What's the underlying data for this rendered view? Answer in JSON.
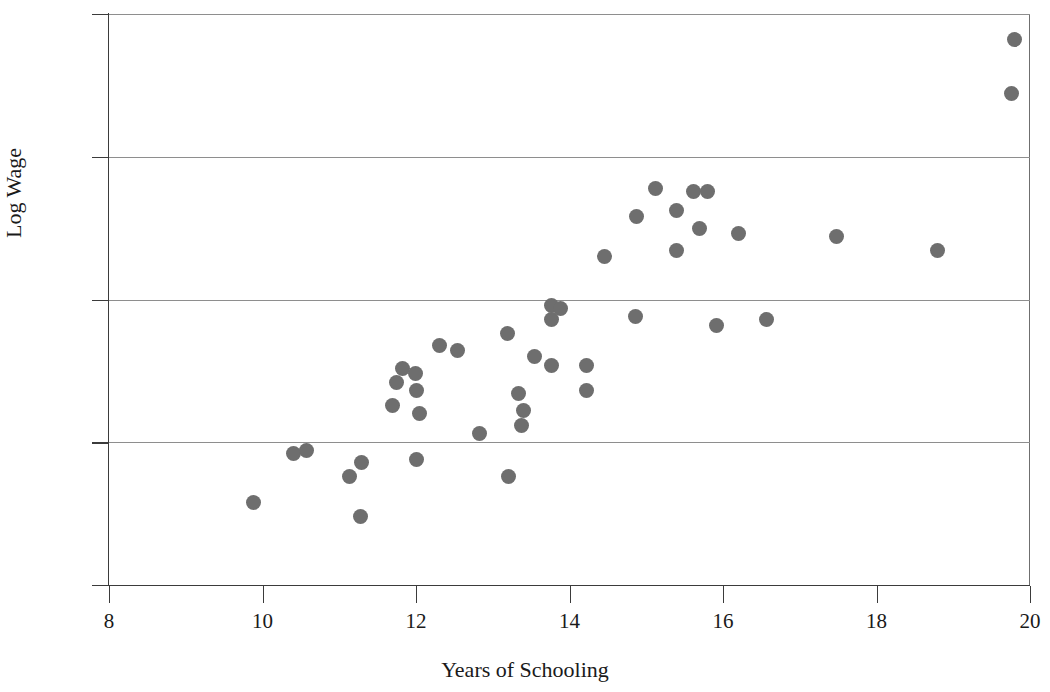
{
  "chart_data": {
    "type": "scatter",
    "title": "",
    "xlabel": "Years of Schooling",
    "ylabel": "Log Wage",
    "xlim": [
      8,
      20
    ],
    "ylim": [
      2,
      4
    ],
    "xticks": [
      "8",
      "10",
      "12",
      "14",
      "16",
      "18",
      "20"
    ],
    "xtick_values": [
      8,
      10,
      12,
      14,
      16,
      18,
      20
    ],
    "yticks": [
      "2",
      "2.5",
      "3",
      "3.5",
      "4"
    ],
    "ytick_values": [
      2,
      2.5,
      3,
      3.5,
      4
    ],
    "grid": "horizontal",
    "gridline_values": [
      2.5,
      3,
      3.5,
      4
    ],
    "legend": null,
    "marker_color": "#6e6e6e",
    "marker_shape": "circle",
    "marker_size_px": 15,
    "point_count": 48,
    "points": [
      {
        "x": 9.88,
        "y": 2.29
      },
      {
        "x": 10.41,
        "y": 2.46
      },
      {
        "x": 10.57,
        "y": 2.47
      },
      {
        "x": 11.14,
        "y": 2.38
      },
      {
        "x": 11.29,
        "y": 2.43
      },
      {
        "x": 11.28,
        "y": 2.24
      },
      {
        "x": 11.7,
        "y": 2.63
      },
      {
        "x": 11.74,
        "y": 2.71
      },
      {
        "x": 11.83,
        "y": 2.76
      },
      {
        "x": 11.99,
        "y": 2.74
      },
      {
        "x": 12.0,
        "y": 2.68
      },
      {
        "x": 12.04,
        "y": 2.6
      },
      {
        "x": 12.0,
        "y": 2.44
      },
      {
        "x": 12.31,
        "y": 2.84
      },
      {
        "x": 12.54,
        "y": 2.82
      },
      {
        "x": 12.83,
        "y": 2.53
      },
      {
        "x": 13.19,
        "y": 2.88
      },
      {
        "x": 13.2,
        "y": 2.38
      },
      {
        "x": 13.33,
        "y": 2.67
      },
      {
        "x": 13.4,
        "y": 2.61
      },
      {
        "x": 13.38,
        "y": 2.56
      },
      {
        "x": 13.54,
        "y": 2.8
      },
      {
        "x": 13.76,
        "y": 2.77
      },
      {
        "x": 13.76,
        "y": 2.93
      },
      {
        "x": 13.77,
        "y": 2.98
      },
      {
        "x": 13.88,
        "y": 2.97
      },
      {
        "x": 14.22,
        "y": 2.77
      },
      {
        "x": 14.22,
        "y": 2.68
      },
      {
        "x": 14.45,
        "y": 3.15
      },
      {
        "x": 14.86,
        "y": 2.94
      },
      {
        "x": 14.87,
        "y": 3.29
      },
      {
        "x": 15.12,
        "y": 3.39
      },
      {
        "x": 15.39,
        "y": 3.31
      },
      {
        "x": 15.4,
        "y": 3.17
      },
      {
        "x": 15.62,
        "y": 3.38
      },
      {
        "x": 15.8,
        "y": 3.38
      },
      {
        "x": 15.69,
        "y": 3.25
      },
      {
        "x": 15.92,
        "y": 2.91
      },
      {
        "x": 16.2,
        "y": 3.23
      },
      {
        "x": 16.57,
        "y": 2.93
      },
      {
        "x": 17.48,
        "y": 3.22
      },
      {
        "x": 18.79,
        "y": 3.17
      },
      {
        "x": 19.8,
        "y": 3.91
      },
      {
        "x": 19.76,
        "y": 3.72
      }
    ]
  }
}
